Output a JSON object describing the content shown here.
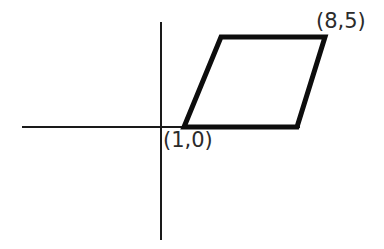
{
  "figure": {
    "kind": "coordinate-plane-parallelogram",
    "canvas": {
      "width": 384,
      "height": 249,
      "background": "#ffffff"
    },
    "colors": {
      "axis": "#1a1a1a",
      "shape_stroke": "#0d0d0d",
      "label_text": "#2b2b2b"
    },
    "axes": {
      "x_axis": {
        "name": "x-axis",
        "y_pixel": 127,
        "x_start_pixel": 22,
        "x_end_pixel": 300,
        "stroke_width": 2
      },
      "y_axis": {
        "name": "y-axis",
        "x_pixel": 161,
        "y_start_pixel": 22,
        "y_end_pixel": 240,
        "stroke_width": 2
      },
      "origin_pixel": {
        "x": 161,
        "y": 127
      }
    },
    "shape": {
      "name": "parallelogram",
      "stroke_width": 5,
      "vertices_pixel": [
        {
          "name": "bottom-left",
          "x": 184,
          "y": 127
        },
        {
          "name": "bottom-right",
          "x": 297,
          "y": 127
        },
        {
          "name": "top-right",
          "x": 325,
          "y": 37
        },
        {
          "name": "top-left",
          "x": 221,
          "y": 37
        }
      ]
    },
    "labels": [
      {
        "id": "top-right",
        "text": "(8,5)",
        "describes_vertex": "top-right",
        "x": 8,
        "y": 5
      },
      {
        "id": "bottom-left",
        "text": "(1,0)",
        "describes_vertex": "bottom-left",
        "x": 1,
        "y": 0
      }
    ]
  },
  "chart_data": {
    "type": "scatter",
    "title": "",
    "xlabel": "",
    "ylabel": "",
    "grid": false,
    "legend": "none",
    "annotations": [
      "(8,5)",
      "(1,0)"
    ],
    "shapes": [
      {
        "type": "polygon",
        "name": "parallelogram",
        "closed": true,
        "points": [
          [
            1,
            0
          ],
          [
            8,
            0
          ],
          [
            9.7,
            5
          ],
          [
            2.7,
            5
          ]
        ],
        "labeled_points": [
          {
            "label": "(1,0)",
            "x": 1,
            "y": 0
          },
          {
            "label": "(8,5)",
            "x": 8,
            "y": 5
          }
        ]
      }
    ]
  }
}
